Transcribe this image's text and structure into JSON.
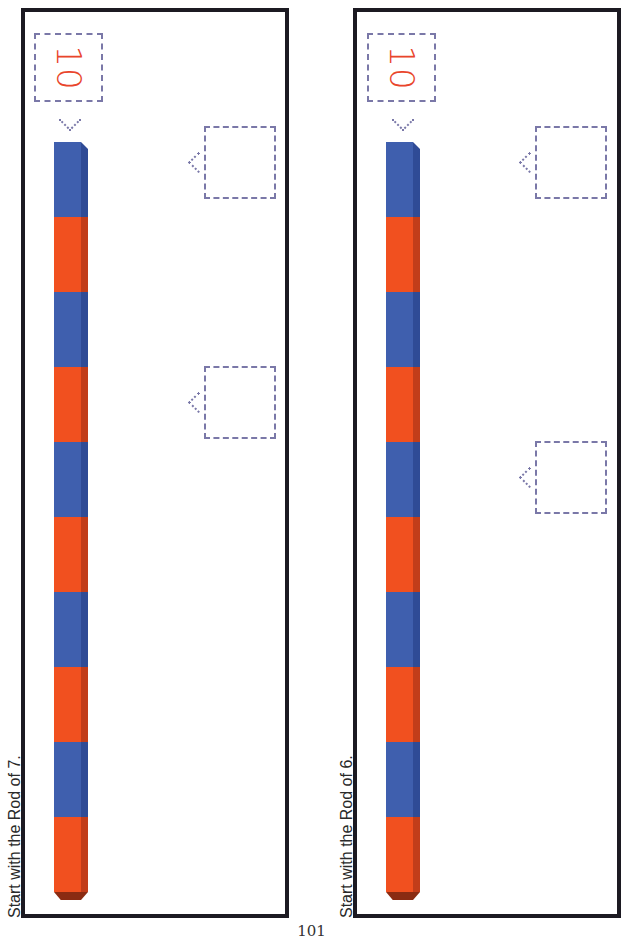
{
  "panels": [
    {
      "instruction": "Start with the Rod of 7.",
      "label_number": "10",
      "segments": [
        "blue",
        "red",
        "blue",
        "red",
        "blue",
        "red",
        "blue",
        "red",
        "blue",
        "red"
      ],
      "answer_boxes": [
        {
          "top": 126
        },
        {
          "top": 366
        }
      ]
    },
    {
      "instruction": "Start with the Rod of 6.",
      "label_number": "10",
      "segments": [
        "blue",
        "red",
        "blue",
        "red",
        "blue",
        "red",
        "blue",
        "red",
        "blue",
        "red"
      ],
      "answer_boxes": [
        {
          "top": 126
        },
        {
          "top": 441
        }
      ]
    }
  ],
  "page_number": "101",
  "colors": {
    "blue": "#3f5fae",
    "red": "#f1501f",
    "label": "#e9452b",
    "dashed": "#7a78a8",
    "border": "#1c1a22"
  }
}
